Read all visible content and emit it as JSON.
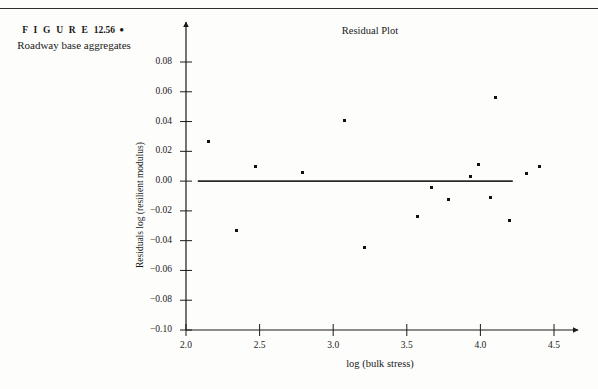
{
  "figure": {
    "label": "F I G U R E",
    "number": "12.56",
    "bullet": "●",
    "caption": "Roadway base aggregates"
  },
  "chart_data": {
    "type": "scatter",
    "title": "Residual Plot",
    "xlabel": "log (bulk stress)",
    "ylabel": "Residuals log (resilient modulus)",
    "xlim": [
      2.0,
      4.5
    ],
    "ylim": [
      -0.1,
      0.08
    ],
    "grid": false,
    "legend": null,
    "xticks": [
      "2.0",
      "2.5",
      "3.0",
      "3.5",
      "4.0",
      "4.5"
    ],
    "xtick_values": [
      2.0,
      2.5,
      3.0,
      3.5,
      4.0,
      4.5
    ],
    "yticks": [
      "0.08",
      "0.06",
      "0.04",
      "0.02",
      "0.00",
      "−0.02",
      "−0.04",
      "−0.06",
      "−0.08",
      "−0.10"
    ],
    "ytick_values": [
      0.08,
      0.06,
      0.04,
      0.02,
      0.0,
      -0.02,
      -0.04,
      -0.06,
      -0.08,
      -0.1
    ],
    "reference_line": {
      "y": 0.0,
      "x_start": 2.08,
      "x_end": 4.22
    },
    "points": [
      {
        "x": 2.15,
        "y": 0.0265
      },
      {
        "x": 2.34,
        "y": -0.0335
      },
      {
        "x": 2.47,
        "y": 0.0095
      },
      {
        "x": 2.79,
        "y": 0.0055
      },
      {
        "x": 3.08,
        "y": 0.041
      },
      {
        "x": 3.21,
        "y": -0.0445
      },
      {
        "x": 3.57,
        "y": -0.0235
      },
      {
        "x": 3.67,
        "y": -0.0045
      },
      {
        "x": 3.78,
        "y": -0.0125
      },
      {
        "x": 3.93,
        "y": 0.003
      },
      {
        "x": 3.99,
        "y": 0.011
      },
      {
        "x": 4.07,
        "y": -0.011
      },
      {
        "x": 4.1,
        "y": 0.056
      },
      {
        "x": 4.2,
        "y": -0.0265
      },
      {
        "x": 4.31,
        "y": 0.005
      },
      {
        "x": 4.4,
        "y": 0.01
      }
    ]
  }
}
